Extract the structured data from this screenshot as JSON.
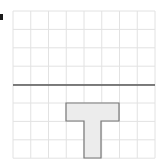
{
  "figure": {
    "label_marker": "■",
    "grid": {
      "columns": 8,
      "rows": 8,
      "x0": 13,
      "y0": 11,
      "cell_w": 17.75,
      "cell_h": 18.4,
      "line_color": "#e2e2e2"
    },
    "mirror_line": {
      "y": 85,
      "x1": 13,
      "x2": 155,
      "color": "#555555"
    },
    "shape": {
      "name": "T-shape",
      "fill": "#ececec",
      "stroke": "#777777",
      "points": "66,103 119,103 119,121 101,121 101,158 84,158 84,121 66,121"
    }
  }
}
